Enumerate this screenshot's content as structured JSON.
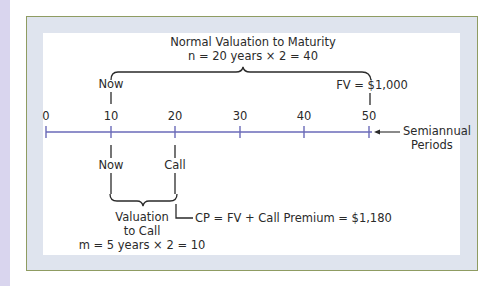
{
  "diagram": {
    "title_line1": "Normal Valuation to Maturity",
    "title_line2": "n = 20 years × 2 = 40",
    "top_now_label": "Now",
    "fv_label": "FV = $1,000",
    "axis": {
      "ticks": [
        "0",
        "10",
        "20",
        "30",
        "40",
        "50"
      ],
      "unit_label_line1": "Semiannual",
      "unit_label_line2": "Periods"
    },
    "bottom_now_label": "Now",
    "call_label": "Call",
    "valuation_line1": "Valuation",
    "valuation_line2": "to Call",
    "call_formula": "m = 5 years × 2 = 10",
    "cp_label": "CP = FV + Call Premium = $1,180"
  },
  "colors": {
    "axis": "#6a6ab8",
    "text": "#2a2a2a",
    "frame_band": "#dfe4ee",
    "frame_border": "#8f9c62",
    "left_strip": "#d9d5ee"
  }
}
